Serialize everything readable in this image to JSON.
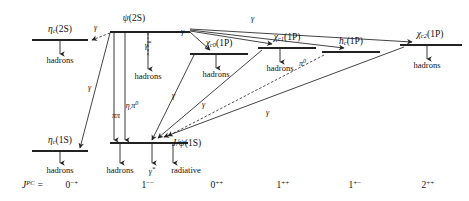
{
  "figure": {
    "type": "charmonium-energy-level-decay-diagram",
    "width": 469,
    "height": 201,
    "background": "#ffffff",
    "line_color": "#222222"
  },
  "levels": [
    {
      "id": "eta_c_2s",
      "name_main": "η",
      "name_sub": "c",
      "name_tail": "(2S)",
      "x": 60,
      "y": 33,
      "half_width": 28,
      "decay_label": "hadrons"
    },
    {
      "id": "psi_2s",
      "name_main": "ψ",
      "name_sub": "",
      "name_tail": "(2S)",
      "x": 134,
      "y": 26,
      "half_width": 34,
      "decay_label": "hadrons"
    },
    {
      "id": "chi_c0_1p",
      "name_main": "χ",
      "name_sub": "c0",
      "name_tail": "(1P)",
      "x": 216,
      "y": 47,
      "half_width": 28,
      "decay_label": "hadrons"
    },
    {
      "id": "chi_c1_1p",
      "name_main": "χ",
      "name_sub": "c1",
      "name_tail": "(1P)",
      "x": 283,
      "y": 41,
      "half_width": 28,
      "decay_label": "hadrons"
    },
    {
      "id": "h_c_1p",
      "name_main": "h",
      "name_sub": "c",
      "name_tail": "(1P)",
      "x": 349,
      "y": 44,
      "half_width": 28,
      "decay_label": ""
    },
    {
      "id": "chi_c2_1p",
      "name_main": "χ",
      "name_sub": "c2",
      "name_tail": "(1P)",
      "x": 427,
      "y": 38,
      "half_width": 30,
      "decay_label": "hadrons"
    },
    {
      "id": "eta_c_1s",
      "name_main": "η",
      "name_sub": "c",
      "name_tail": "(1S)",
      "x": 60,
      "y": 144,
      "half_width": 28,
      "decay_label": "hadrons"
    },
    {
      "id": "jpsi_1s",
      "name_main": "J/ψ",
      "name_sub": "",
      "name_tail": "(1S)",
      "x": 136,
      "y": 136,
      "half_width": 34,
      "decay_label": ""
    }
  ],
  "transition_labels": [
    {
      "id": "psi2s-to-etac2s",
      "text": "γ",
      "x": 97,
      "y": 29
    },
    {
      "id": "psi2s-to-etac1s",
      "text": "γ",
      "x": 90,
      "y": 88
    },
    {
      "id": "psi2s-virtual-photon",
      "text": "γ",
      "star": "*",
      "x": 148,
      "y": 46
    },
    {
      "id": "psi2s-to-jpsi-pipi",
      "text": "ππ",
      "x": 119,
      "y": 112
    },
    {
      "id": "psi2s-to-jpsi-eta-pi0",
      "text": "η",
      "sub": " ",
      "sup": "0",
      "x": 130,
      "y": 101
    },
    {
      "id": "psi2s-to-chic0",
      "text": "γ",
      "x": 183,
      "y": 35
    },
    {
      "id": "psi2s-to-chic1",
      "text": "γ",
      "x": 253,
      "y": 21
    },
    {
      "id": "chic0-to-jpsi",
      "text": "γ",
      "x": 174,
      "y": 97
    },
    {
      "id": "chic1-to-jpsi",
      "text": "γ",
      "x": 204,
      "y": 106
    },
    {
      "id": "chic2-to-jpsi",
      "text": "γ",
      "x": 268,
      "y": 114
    },
    {
      "id": "hc-to-etac1s",
      "text": "π",
      "sup": "0",
      "x": 300,
      "y": 60
    }
  ],
  "decay_products": [
    {
      "id": "etac2s-hadrons",
      "text": "hadrons",
      "x": 60,
      "y": 56
    },
    {
      "id": "psi2s-hadrons",
      "text": "hadrons",
      "x": 148,
      "y": 72
    },
    {
      "id": "chic0-hadrons",
      "text": "hadrons",
      "x": 216,
      "y": 70
    },
    {
      "id": "chic1-hadrons",
      "text": "hadrons",
      "x": 280,
      "y": 64
    },
    {
      "id": "chic2-hadrons",
      "text": "hadrons",
      "x": 427,
      "y": 61
    },
    {
      "id": "etac1s-hadrons",
      "text": "hadrons",
      "x": 60,
      "y": 166
    },
    {
      "id": "jpsi-hadrons",
      "text": "hadrons",
      "x": 120,
      "y": 166
    },
    {
      "id": "jpsi-virtual-photon",
      "text": "γ",
      "star": "*",
      "x": 154,
      "y": 166
    },
    {
      "id": "jpsi-radiative",
      "text": "radiative",
      "x": 185,
      "y": 166
    }
  ],
  "jpc_row": {
    "label_main": "J",
    "label_sup": "PC",
    "label_eq": " =",
    "label_x": 22,
    "y": 186,
    "entries": [
      {
        "id": "jpc-0mp",
        "base": "0",
        "sup": "−+",
        "x": 72
      },
      {
        "id": "jpc-1mm",
        "base": "1",
        "sup": "−−",
        "x": 148
      },
      {
        "id": "jpc-0pp",
        "base": "0",
        "sup": "++",
        "x": 217
      },
      {
        "id": "jpc-1pp",
        "base": "1",
        "sup": "++",
        "x": 283
      },
      {
        "id": "jpc-1pm",
        "base": "1",
        "sup": "+−",
        "x": 355
      },
      {
        "id": "jpc-2pp",
        "base": "2",
        "sup": "++",
        "x": 428
      }
    ]
  }
}
